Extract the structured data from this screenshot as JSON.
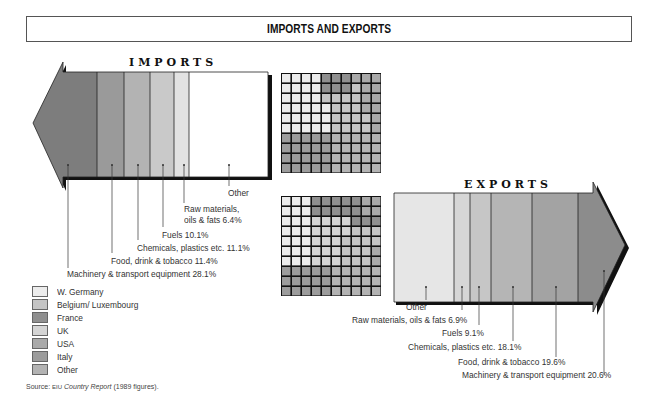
{
  "title": "IMPORTS AND EXPORTS",
  "imports": {
    "title": "IMPORTS",
    "labels": {
      "other": "Other",
      "raw_materials_1": "Raw materials,",
      "raw_materials_2": "oils & fats 6.4%",
      "fuels": "Fuels 10.1%",
      "chemicals": "Chemicals, plastics etc. 11.1%",
      "food": "Food, drink & tobacco 11.4%",
      "machinery": "Machinery & transport equipment 28.1%"
    }
  },
  "exports": {
    "title": "EXPORTS",
    "labels": {
      "other": "Other",
      "raw_materials": "Raw materials, oils & fats 6.9%",
      "fuels": "Fuels 9.1%",
      "chemicals": "Chemicals, plastics etc. 18.1%",
      "food": "Food, drink & tobacco 19.6%",
      "machinery": "Machinery & transport equipment 20.6%"
    }
  },
  "legend": {
    "items": [
      {
        "label": "W. Germany",
        "color": "#ececec"
      },
      {
        "label": "Belgium/ Luxembourg",
        "color": "#c4c4c4"
      },
      {
        "label": "France",
        "color": "#8f8f8f"
      },
      {
        "label": "UK",
        "color": "#d4d4d4"
      },
      {
        "label": "USA",
        "color": "#a9a9a9"
      },
      {
        "label": "Italy",
        "color": "#9c9c9c"
      },
      {
        "label": "Other",
        "color": "#b3b3b3"
      }
    ]
  },
  "source": {
    "prefix": "Source:",
    "org": "EIU",
    "publication": "Country Report",
    "suffix": "(1989 figures)."
  },
  "chart_data": [
    {
      "type": "bar",
      "title": "IMPORTS",
      "orientation": "horizontal-stacked-arrow",
      "categories": [
        "Machinery & transport equipment",
        "Food, drink & tobacco",
        "Chemicals, plastics etc.",
        "Fuels",
        "Raw materials, oils & fats",
        "Other"
      ],
      "values": [
        28.1,
        11.4,
        11.1,
        10.1,
        6.4,
        32.9
      ],
      "unit": "%"
    },
    {
      "type": "bar",
      "title": "EXPORTS",
      "orientation": "horizontal-stacked-arrow",
      "categories": [
        "Other",
        "Raw materials, oils & fats",
        "Fuels",
        "Chemicals, plastics etc.",
        "Food, drink & tobacco",
        "Machinery & transport equipment"
      ],
      "values": [
        25.7,
        6.9,
        9.1,
        18.1,
        19.6,
        20.6
      ],
      "unit": "%"
    },
    {
      "type": "heatmap",
      "title": "Imports by origin (10x10 grid)",
      "legend": [
        "W. Germany",
        "Belgium/ Luxembourg",
        "France",
        "UK",
        "USA",
        "Italy",
        "Other"
      ]
    },
    {
      "type": "heatmap",
      "title": "Exports by destination (10x10 grid)",
      "legend": [
        "W. Germany",
        "Belgium/ Luxembourg",
        "France",
        "UK",
        "USA",
        "Italy",
        "Other"
      ]
    }
  ]
}
